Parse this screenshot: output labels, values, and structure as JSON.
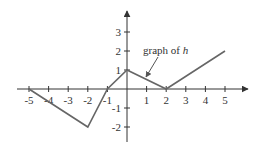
{
  "chart_data": {
    "type": "line",
    "title": "",
    "xlabel": "",
    "ylabel": "",
    "series": [
      {
        "name": "h",
        "x": [
          -5,
          -2,
          -1,
          0,
          2,
          5
        ],
        "y": [
          0,
          -2,
          0,
          1,
          0,
          2
        ]
      }
    ],
    "x_ticks": [
      -5,
      -4,
      -3,
      -2,
      -1,
      1,
      2,
      3,
      4,
      5
    ],
    "y_ticks": [
      -2,
      -1,
      1,
      2,
      3
    ],
    "xlim": [
      -5.6,
      6
    ],
    "ylim": [
      -2.9,
      4
    ],
    "grid": false,
    "annotations": [
      {
        "text_prefix": "graph of ",
        "text_var": "h",
        "points_to": [
          0.7,
          0.6
        ]
      }
    ]
  },
  "labels": {
    "annotation_prefix": "graph of ",
    "annotation_var": "h"
  },
  "colors": {
    "line": "#666666",
    "axis": "#333333"
  }
}
